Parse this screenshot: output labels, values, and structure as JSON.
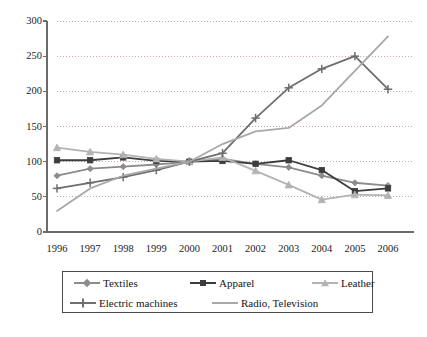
{
  "chart_data": {
    "type": "line",
    "title": "",
    "subtitle": "",
    "xlabel": "",
    "ylabel": "",
    "categories": [
      "1996",
      "1997",
      "1998",
      "1999",
      "2000",
      "2001",
      "2002",
      "2003",
      "2004",
      "2005",
      "2006"
    ],
    "x": [
      1996,
      1997,
      1998,
      1999,
      2000,
      2001,
      2002,
      2003,
      2004,
      2005,
      2006
    ],
    "ylim": [
      0,
      300
    ],
    "yticks": [
      0,
      50,
      100,
      150,
      200,
      250,
      300
    ],
    "ytick_labels": [
      "0",
      "50",
      "100",
      "150",
      "200",
      "250",
      "300"
    ],
    "grid": "horizontal-dotted",
    "legend_position": "bottom",
    "series": [
      {
        "name": "Textiles",
        "marker": "diamond",
        "color": "#8c8c8c",
        "values": [
          80,
          90,
          93,
          96,
          100,
          104,
          97,
          92,
          80,
          70,
          66
        ]
      },
      {
        "name": "Apparel",
        "marker": "square",
        "color": "#3d3d3d",
        "values": [
          102,
          102,
          106,
          101,
          100,
          101,
          97,
          102,
          88,
          58,
          62
        ]
      },
      {
        "name": "Leather",
        "marker": "triangle",
        "color": "#b3b3b3",
        "values": [
          120,
          114,
          110,
          104,
          100,
          106,
          87,
          67,
          46,
          53,
          52
        ]
      },
      {
        "name": "Electric machines",
        "marker": "plus",
        "color": "#6e6e6e",
        "values": [
          62,
          70,
          78,
          88,
          100,
          112,
          162,
          205,
          232,
          250,
          203
        ]
      },
      {
        "name": "Radio, Television",
        "marker": "none",
        "color": "#a8a8a8",
        "values": [
          30,
          62,
          80,
          90,
          100,
          125,
          143,
          148,
          180,
          229,
          278
        ]
      }
    ]
  },
  "axes": {
    "axis_color": "#6b6b6b",
    "grid_color": "#c9a9a9",
    "plot_background": "#ffffff"
  },
  "legend": {
    "rows": [
      [
        "Textiles",
        "Apparel",
        "Leather"
      ],
      [
        "Electric machines",
        "Radio, Television"
      ]
    ]
  }
}
